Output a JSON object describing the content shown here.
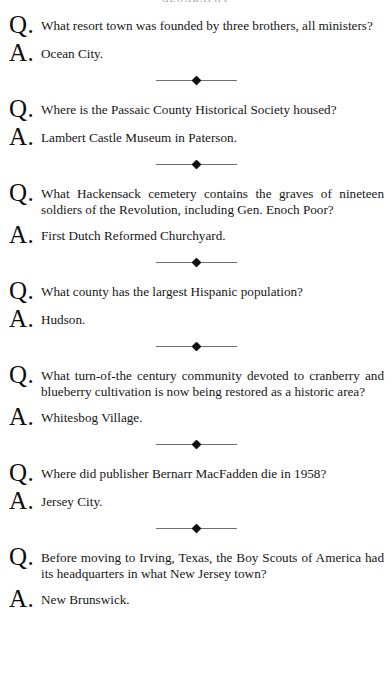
{
  "page": {
    "running_head": "GEOGRAPHY",
    "background_color": "#ffffff",
    "text_color": "#161616",
    "marker_color": "#0d0d0d",
    "rule_color": "#6f6f6f"
  },
  "labels": {
    "question_marker": "Q.",
    "answer_marker": "A."
  },
  "entries": [
    {
      "question": "What resort town was founded by three brothers, all ministers?",
      "answer": "Ocean City."
    },
    {
      "question": "Where is the Passaic County Historical Society housed?",
      "answer": "Lambert Castle Museum in Paterson."
    },
    {
      "question": "What Hackensack cemetery contains the graves of nineteen soldiers of the Revolution, including Gen. Enoch Poor?",
      "answer": "First Dutch Reformed Churchyard."
    },
    {
      "question": "What county has the largest Hispanic population?",
      "answer": "Hudson."
    },
    {
      "question": "What turn-of-the century community devoted to cranberry and blueberry cultivation is now being restored as a historic area?",
      "answer": "Whitesbog Village."
    },
    {
      "question": "Where did publisher Bernarr MacFadden die in 1958?",
      "answer": "Jersey City."
    },
    {
      "question": "Before moving to Irving, Texas, the Boy Scouts of America had its headquarters in what New Jersey town?",
      "answer": "New Brunswick."
    }
  ]
}
